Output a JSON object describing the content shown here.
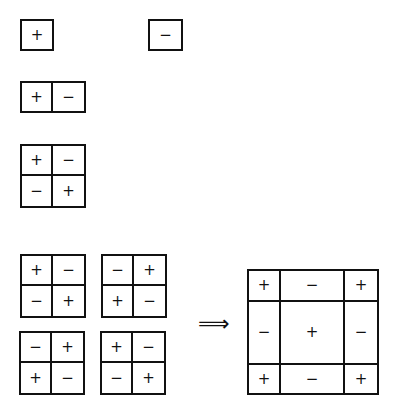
{
  "diagram": {
    "single_plus": {
      "cells": [
        "+"
      ]
    },
    "single_minus": {
      "cells": [
        "−"
      ]
    },
    "pair": {
      "cells": [
        "+",
        "−"
      ]
    },
    "checker": {
      "cells": [
        "+",
        "−",
        "−",
        "+"
      ]
    },
    "quad": [
      {
        "cells": [
          "+",
          "−",
          "−",
          "+"
        ]
      },
      {
        "cells": [
          "−",
          "+",
          "+",
          "−"
        ]
      },
      {
        "cells": [
          "−",
          "+",
          "+",
          "−"
        ]
      },
      {
        "cells": [
          "+",
          "−",
          "−",
          "+"
        ]
      }
    ],
    "arrow": "⟹",
    "result": {
      "cells": [
        "+",
        "−",
        "+",
        "−",
        "+",
        "−",
        "+",
        "−",
        "+"
      ]
    }
  }
}
